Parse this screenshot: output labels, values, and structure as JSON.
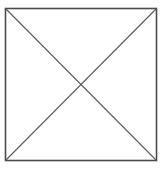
{
  "figure": {
    "kind": "geometric-line-drawing",
    "background_color": "#ffffff",
    "canvas": {
      "width": 164,
      "height": 170
    },
    "square": {
      "name": "square-outline",
      "x": 5.5,
      "y": 8.5,
      "width": 151,
      "height": 152,
      "stroke_color": "#4a4a4a",
      "stroke_width": 1.6,
      "fill": "none",
      "corners": {
        "top_left": [
          5.5,
          8.5
        ],
        "top_right": [
          156.5,
          8.5
        ],
        "bottom_right": [
          156.5,
          160.5
        ],
        "bottom_left": [
          5.5,
          160.5
        ]
      }
    },
    "diagonals": [
      {
        "name": "diagonal-top-left-to-bottom-right",
        "x1": 5.5,
        "y1": 8.5,
        "x2": 156.5,
        "y2": 160.5,
        "stroke_color": "#5a5a5a",
        "stroke_width": 1.1
      },
      {
        "name": "diagonal-bottom-left-to-top-right",
        "x1": 5.5,
        "y1": 160.5,
        "x2": 156.5,
        "y2": 8.5,
        "stroke_color": "#5a5a5a",
        "stroke_width": 1.1
      }
    ],
    "intersection_point": {
      "x": 81,
      "y": 84.5
    }
  }
}
